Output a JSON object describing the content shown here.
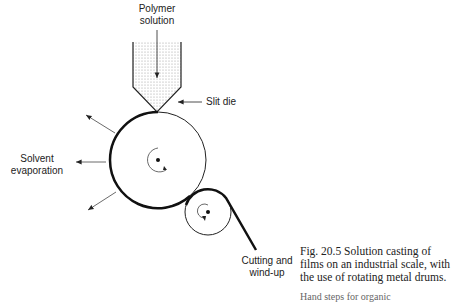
{
  "diagram": {
    "labels": {
      "polymer_solution": [
        "Polymer",
        "solution"
      ],
      "slit_die": "Slit die",
      "solvent_evaporation": [
        "Solvent",
        "evaporation"
      ],
      "cutting_windup": [
        "Cutting and",
        "wind-up"
      ]
    },
    "caption": {
      "line1": "Fig. 20.5  Solution casting of",
      "line2": "films on an industrial scale, with",
      "line3": "the use of rotating metal drums."
    },
    "footer_partial": "Hand steps for organic"
  }
}
